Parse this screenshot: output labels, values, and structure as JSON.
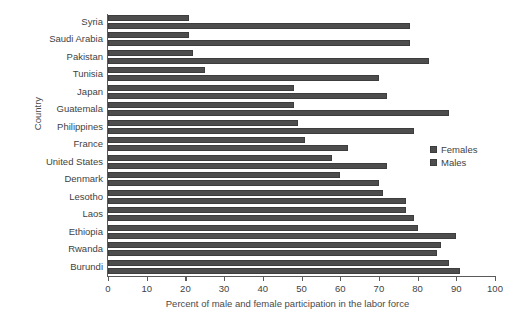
{
  "chart_data": {
    "type": "bar",
    "orientation": "horizontal",
    "grouped": true,
    "title": "",
    "xlabel": "Percent of male and female participation in the labor force",
    "ylabel": "Country",
    "xlim": [
      0,
      100
    ],
    "xticks": [
      0,
      10,
      20,
      30,
      40,
      50,
      60,
      70,
      80,
      90,
      100
    ],
    "grid": false,
    "legend_position": "right",
    "bar_color": "#4d4d4d",
    "categories": [
      "Syria",
      "Saudi Arabia",
      "Pakistan",
      "Tunisia",
      "Japan",
      "Guatemala",
      "Philippines",
      "France",
      "United States",
      "Denmark",
      "Lesotho",
      "Laos",
      "Ethiopia",
      "Rwanda",
      "Burundi"
    ],
    "series": [
      {
        "name": "Females",
        "values": [
          21,
          21,
          22,
          25,
          48,
          48,
          49,
          51,
          58,
          60,
          71,
          77,
          80,
          86,
          88
        ]
      },
      {
        "name": "Males",
        "values": [
          78,
          78,
          83,
          70,
          72,
          88,
          79,
          62,
          72,
          70,
          77,
          79,
          90,
          85,
          91
        ]
      }
    ]
  },
  "legend": {
    "items": [
      {
        "label": "Females"
      },
      {
        "label": "Males"
      }
    ]
  }
}
